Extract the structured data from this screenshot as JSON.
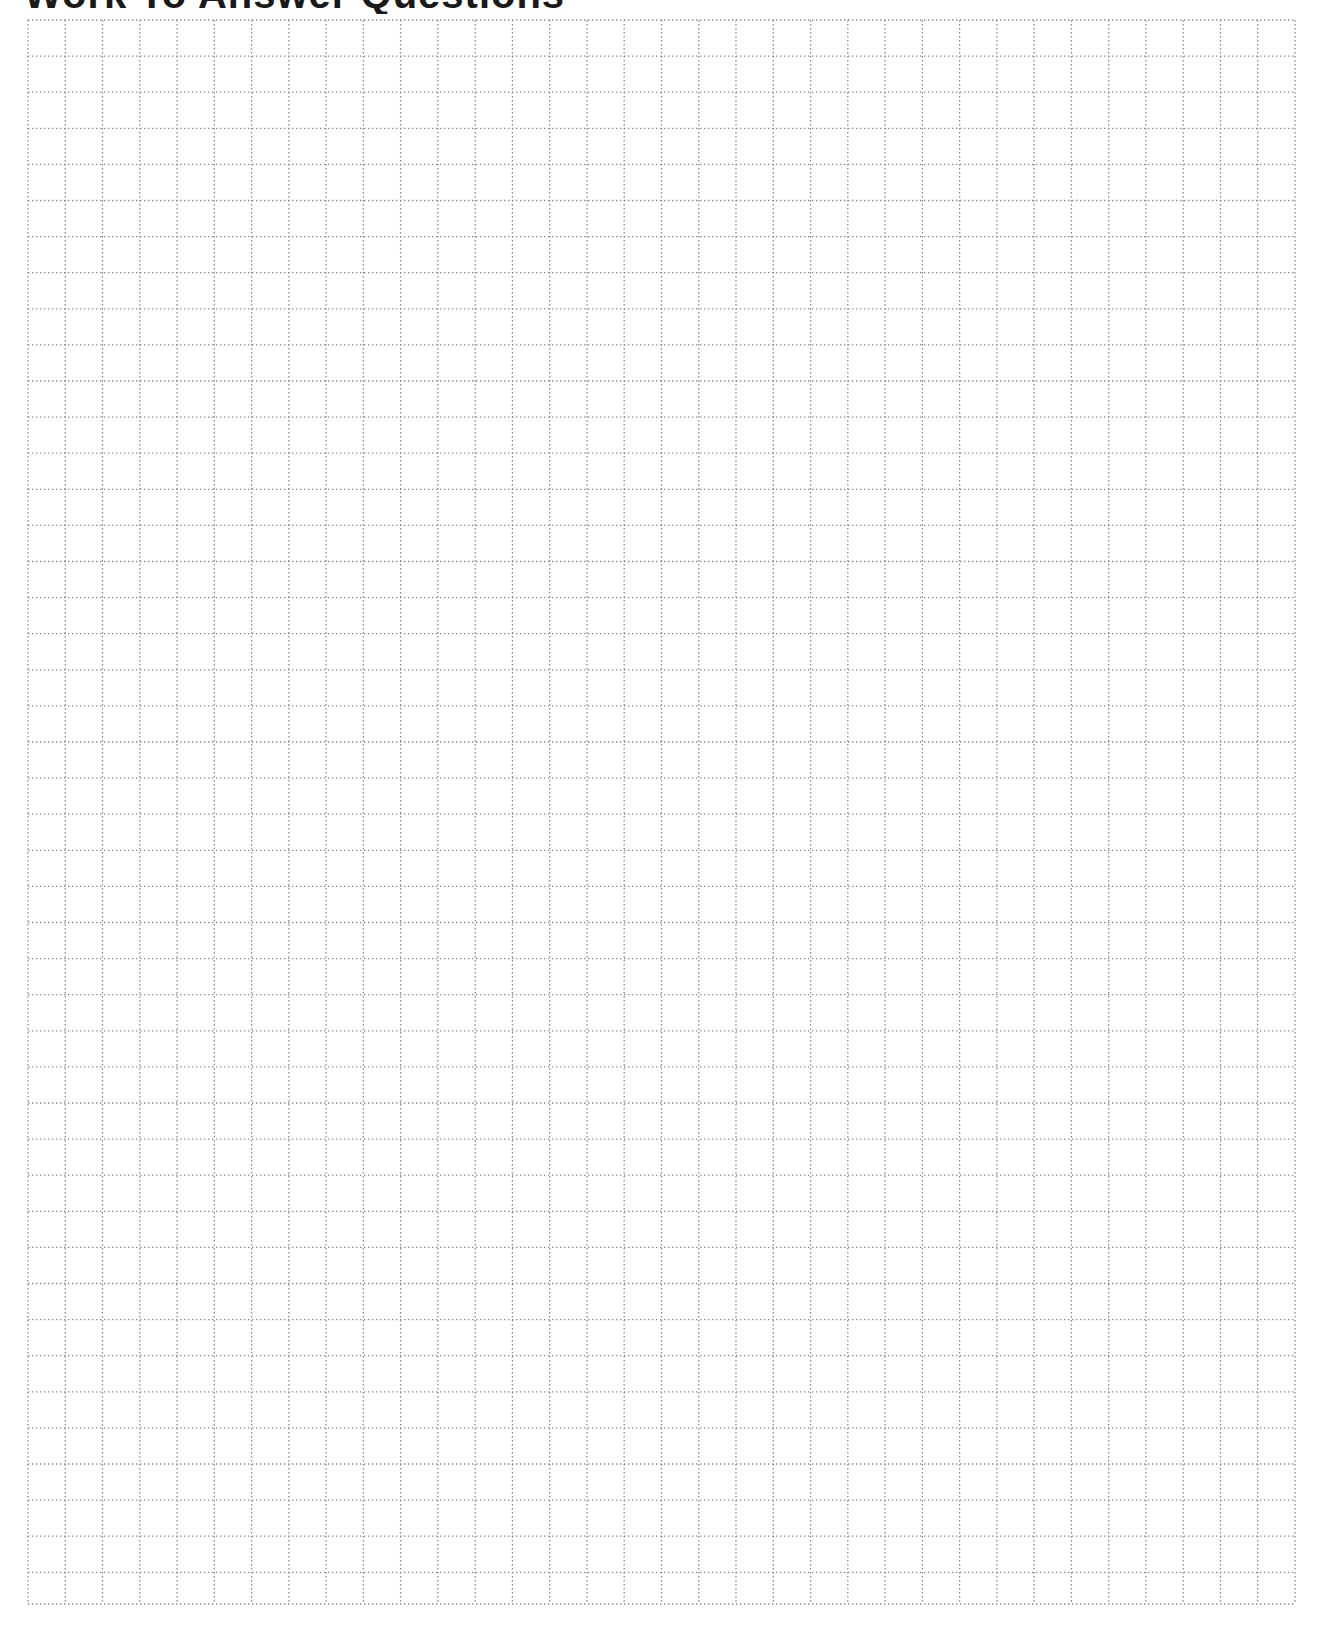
{
  "page": {
    "title": "Work To Answer Questions",
    "title_clipped": true
  },
  "grid": {
    "columns": 34,
    "rows": 44,
    "left": 28,
    "top": 20,
    "right": 1295,
    "bottom": 1604,
    "row_height": 36.1,
    "line_style": "dotted",
    "line_color": "#8a8a8a"
  }
}
